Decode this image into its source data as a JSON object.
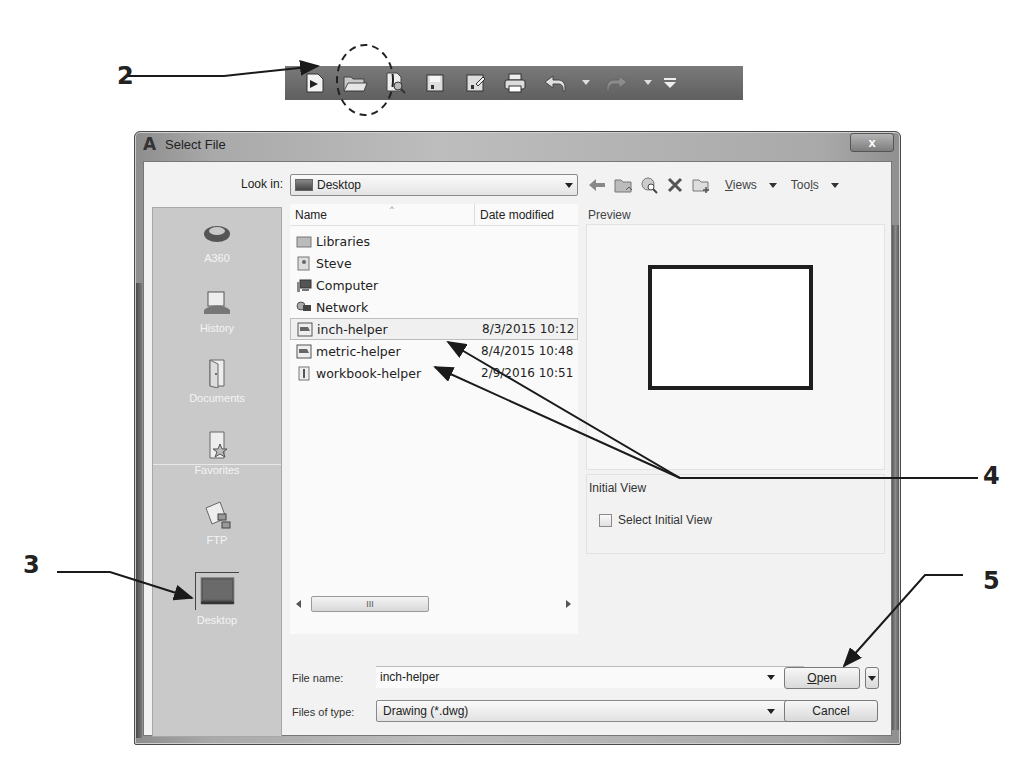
{
  "callouts": [
    {
      "num": "2",
      "target": "open-toolbar-button"
    },
    {
      "num": "3",
      "target": "places-desktop"
    },
    {
      "num": "4",
      "target": "file-list-items"
    },
    {
      "num": "5",
      "target": "open-button"
    }
  ],
  "toolbar": {
    "buttons": [
      {
        "name": "new",
        "icon": "new-drawing-icon"
      },
      {
        "name": "open",
        "icon": "open-folder-icon",
        "highlighted": true
      },
      {
        "name": "sheet-set",
        "icon": "preview-icon"
      },
      {
        "name": "save",
        "icon": "save-icon"
      },
      {
        "name": "save-as",
        "icon": "save-as-icon"
      },
      {
        "name": "plot",
        "icon": "print-icon"
      },
      {
        "name": "undo",
        "icon": "undo-icon"
      },
      {
        "name": "redo",
        "icon": "redo-icon"
      },
      {
        "name": "customize",
        "icon": "customize-icon"
      }
    ]
  },
  "dialog": {
    "title": "Select File",
    "app_icon": "A",
    "close_label": "x",
    "look_in_label": "Look in:",
    "look_in_value": "Desktop",
    "nav": {
      "views_label": "Views",
      "tools_label": "Tools"
    },
    "places": [
      {
        "label": "A360",
        "icon": "a360-icon"
      },
      {
        "label": "History",
        "icon": "history-icon"
      },
      {
        "label": "Documents",
        "icon": "documents-icon"
      },
      {
        "label": "Favorites",
        "icon": "favorites-icon"
      },
      {
        "label": "FTP",
        "icon": "ftp-icon"
      },
      {
        "label": "Desktop",
        "icon": "desktop-icon",
        "selected": true
      }
    ],
    "columns": {
      "name": "Name",
      "date": "Date modified"
    },
    "files": [
      {
        "name": "Libraries",
        "date": "",
        "icon": "libraries-icon"
      },
      {
        "name": "Steve",
        "date": "",
        "icon": "user-folder-icon"
      },
      {
        "name": "Computer",
        "date": "",
        "icon": "computer-icon"
      },
      {
        "name": "Network",
        "date": "",
        "icon": "network-icon"
      },
      {
        "name": "inch-helper",
        "date": "8/3/2015 10:12",
        "icon": "dwg-file-icon",
        "selected": true
      },
      {
        "name": "metric-helper",
        "date": "8/4/2015 10:48",
        "icon": "dwg-file-icon"
      },
      {
        "name": "workbook-helper",
        "date": "2/9/2016 10:51",
        "icon": "dwg-file-icon"
      }
    ],
    "scroll_thumb_label": "III",
    "preview_label": "Preview",
    "initial_view_label": "Initial View",
    "select_initial_view_label": "Select Initial View",
    "select_initial_view_checked": false,
    "file_name_label": "File name:",
    "file_name_value": "inch-helper",
    "files_of_type_label": "Files of type:",
    "files_of_type_value": "Drawing (*.dwg)",
    "open_label": "Open",
    "cancel_label": "Cancel"
  }
}
